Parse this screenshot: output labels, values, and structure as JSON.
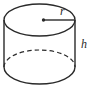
{
  "diagram": {
    "type": "cylinder",
    "labels": {
      "radius": "r",
      "height": "h"
    },
    "colors": {
      "line": "#2a2a2a",
      "background": "#ffffff"
    }
  }
}
